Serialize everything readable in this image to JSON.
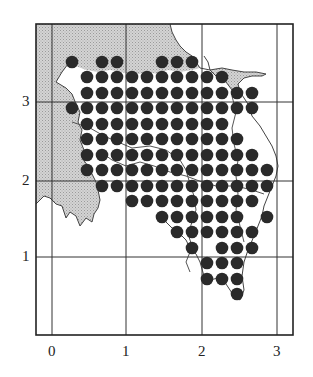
{
  "map": {
    "frame": {
      "left": 36,
      "top": 24,
      "right": 293,
      "bottom": 335
    },
    "colors": {
      "frame": "#222222",
      "grid": "#333333",
      "shaded_region": "#c9c9c9",
      "dot": "#2a2a2a",
      "coast": "#444444"
    },
    "x_axis": {
      "ticks": [
        {
          "label": "0",
          "px": 52
        },
        {
          "label": "1",
          "px": 126
        },
        {
          "label": "2",
          "px": 202
        },
        {
          "label": "3",
          "px": 277
        }
      ]
    },
    "y_axis": {
      "ticks": [
        {
          "label": "1",
          "py": 257
        },
        {
          "label": "2",
          "py": 181
        },
        {
          "label": "3",
          "py": 102
        }
      ]
    },
    "dot_radius": 6.3,
    "dot_rows": [
      {
        "y": 62,
        "xs": [
          72,
          102,
          117,
          162,
          177,
          192
        ]
      },
      {
        "y": 77,
        "xs": [
          87,
          102,
          117,
          132,
          147,
          162,
          177,
          192,
          207,
          222
        ]
      },
      {
        "y": 93,
        "xs": [
          87,
          102,
          117,
          132,
          147,
          162,
          177,
          192,
          207,
          222,
          237,
          252
        ]
      },
      {
        "y": 108,
        "xs": [
          72,
          87,
          102,
          117,
          132,
          147,
          162,
          177,
          192,
          207,
          222,
          237,
          252
        ]
      },
      {
        "y": 124,
        "xs": [
          87,
          102,
          117,
          132,
          147,
          162,
          177,
          192,
          207,
          222
        ]
      },
      {
        "y": 139,
        "xs": [
          87,
          102,
          117,
          132,
          147,
          162,
          177,
          192,
          207,
          222,
          237
        ]
      },
      {
        "y": 155,
        "xs": [
          87,
          102,
          117,
          132,
          147,
          162,
          177,
          192,
          207,
          222,
          237,
          252
        ]
      },
      {
        "y": 170,
        "xs": [
          87,
          102,
          117,
          132,
          147,
          162,
          177,
          192,
          207,
          222,
          237,
          252,
          267
        ]
      },
      {
        "y": 186,
        "xs": [
          102,
          117,
          132,
          147,
          162,
          177,
          192,
          207,
          222,
          237,
          252,
          267
        ]
      },
      {
        "y": 201,
        "xs": [
          132,
          147,
          162,
          177,
          192,
          207,
          222,
          237,
          252
        ]
      },
      {
        "y": 217,
        "xs": [
          162,
          177,
          192,
          207,
          222,
          237,
          267
        ]
      },
      {
        "y": 232,
        "xs": [
          177,
          192,
          207,
          222,
          237,
          252
        ]
      },
      {
        "y": 248,
        "xs": [
          192,
          222,
          237,
          252
        ]
      },
      {
        "y": 263,
        "xs": [
          207,
          222,
          237
        ]
      },
      {
        "y": 279,
        "xs": [
          207,
          222,
          237
        ]
      },
      {
        "y": 294,
        "xs": [
          237
        ]
      }
    ]
  }
}
